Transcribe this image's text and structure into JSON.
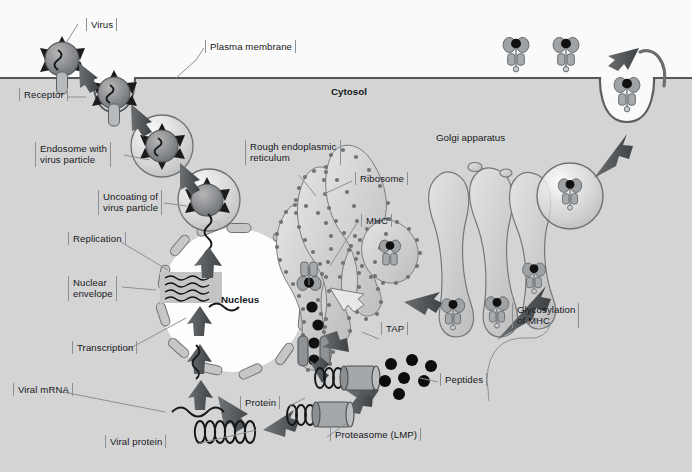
{
  "figure": {
    "canvas": {
      "width": 692,
      "height": 472
    },
    "colors": {
      "extracellular_bg": "#f7f7f7",
      "cytosol_bg": "#d2d2d2",
      "membrane_line": "#55585b",
      "organelle_fill": "#c9c9c9",
      "organelle_stroke": "#5c6063",
      "nucleus_fill": "#fdfdfd",
      "arrow_dark": "#4a4d50",
      "peptide_black": "#0d0d0d",
      "label_bracket": "#8b9094",
      "text": "#14181c"
    }
  },
  "labels": {
    "virus": "Virus",
    "plasma_membrane": "Plasma membrane",
    "cytosol": "Cytosol",
    "receptor": "Receptor",
    "endosome": "Endosome with\nvirus particle",
    "uncoating": "Uncoating of\nvirus particle",
    "replication": "Replication",
    "nuclear_envelope": "Nuclear\nenvelope",
    "nucleus": "Nucleus",
    "transcription": "Transcription",
    "viral_mrna": "Viral mRNA",
    "viral_protein": "Viral protein",
    "protein": "Protein",
    "proteasome": "Proteasome (LMP)",
    "peptides": "Peptides",
    "rough_er": "Rough endoplasmic\nreticulum",
    "ribosome": "Ribosome",
    "mhc": "MHC",
    "tap": "TAP",
    "golgi": "Golgi apparatus",
    "glycosylation": "Glycosylation\nof MHC"
  },
  "structures": {
    "virus_particles": [
      {
        "name": "virus-free-extracellular",
        "cx": 62,
        "cy": 59,
        "r": 17
      },
      {
        "name": "virus-bound-receptor",
        "cx": 114,
        "cy": 93,
        "r": 16
      },
      {
        "name": "virus-in-endosome",
        "cx": 162,
        "cy": 146,
        "r": 16
      },
      {
        "name": "virus-uncoating",
        "cx": 207,
        "cy": 199,
        "r": 16
      }
    ],
    "endosomes": [
      {
        "name": "endosome-early",
        "cx": 162,
        "cy": 146,
        "r": 31
      },
      {
        "name": "endosome-late",
        "cx": 209,
        "cy": 200,
        "r": 31
      }
    ],
    "receptors": [
      {
        "name": "receptor-unbound",
        "x": 62,
        "y": 76
      },
      {
        "name": "receptor-bound",
        "x": 114,
        "y": 93
      }
    ],
    "nucleus": {
      "cx": 233,
      "cy": 300,
      "rx": 72,
      "ry": 72,
      "pore_count": 18
    },
    "golgi_cisternae": 3,
    "surface_mhc_count": 2,
    "peptide_cluster_count": 7,
    "er_lumen_peptides": 4
  },
  "steps": [
    "Virus binds receptor at plasma membrane",
    "Receptor-mediated endocytosis forms endosome with virus particle",
    "Uncoating of virus particle releases genome",
    "Replication in nucleus",
    "Transcription to viral mRNA",
    "Translation to viral protein in cytosol",
    "Proteasome (LMP) degrades protein into peptides",
    "TAP transports peptides into rough endoplasmic reticulum",
    "Peptides load onto MHC in the ER",
    "Glycosylation of MHC in Golgi apparatus",
    "Vesicle transport and fusion presents MHC-peptide at cell surface"
  ]
}
